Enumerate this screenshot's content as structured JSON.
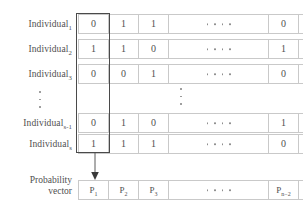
{
  "diagram": {
    "colors": {
      "border": "#c9c9c9",
      "highlight": "#4a4a4a",
      "text": "#4f4f4f",
      "dot": "#8c8c8c",
      "background": "#ffffff"
    },
    "rows": [
      {
        "label_base": "Individual",
        "label_sub": "1",
        "left_cells": [
          "0",
          "1",
          "1"
        ],
        "ellipsis": "....",
        "right_cells": [
          "0",
          "1",
          "0"
        ]
      },
      {
        "label_base": "Individual",
        "label_sub": "2",
        "left_cells": [
          "1",
          "1",
          "0"
        ],
        "ellipsis": "....",
        "right_cells": [
          "1",
          "1",
          "0"
        ]
      },
      {
        "label_base": "Individual",
        "label_sub": "3",
        "left_cells": [
          "0",
          "0",
          "1"
        ],
        "ellipsis": "....",
        "right_cells": [
          "0",
          "1",
          "1"
        ]
      },
      {
        "label_base": "Individual",
        "label_sub": "s-1",
        "left_cells": [
          "0",
          "1",
          "0"
        ],
        "ellipsis": "....",
        "right_cells": [
          "1",
          "1",
          "0"
        ]
      },
      {
        "label_base": "Individual",
        "label_sub": "s",
        "left_cells": [
          "1",
          "1",
          "1"
        ],
        "ellipsis": "....",
        "right_cells": [
          "0",
          "1",
          "1"
        ]
      }
    ],
    "probability": {
      "label_line1": "Probability",
      "label_line2": "vector",
      "left_cells": [
        {
          "base": "P",
          "sub": "1"
        },
        {
          "base": "P",
          "sub": "2"
        },
        {
          "base": "P",
          "sub": "3"
        }
      ],
      "ellipsis": "....",
      "right_cells": [
        {
          "base": "P",
          "sub": "n−2"
        },
        {
          "base": "P",
          "sub": "n−1"
        },
        {
          "base": "P",
          "sub": "n"
        }
      ]
    },
    "vertical_ellipsis_left": "⋮",
    "vertical_ellipsis_center": "⋮",
    "arrow": "down-arrow"
  }
}
